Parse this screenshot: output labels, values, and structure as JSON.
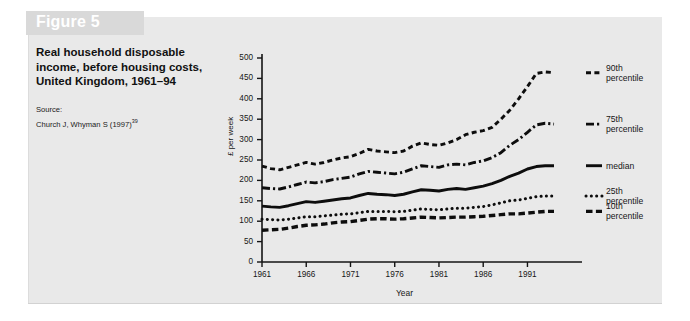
{
  "figure": {
    "banner_label": "Figure 5",
    "title_lines": [
      "Real household disposable",
      "income, before housing costs,",
      "United Kingdom, 1961–94"
    ],
    "source_heading": "Source:",
    "source_citation": "Church J, Whyman S (1997)",
    "source_ref": "39"
  },
  "colors": {
    "panel_background": "#e9e9e9",
    "page_background": "#ffffff",
    "banner": "#d9d9d9",
    "banner_text": "#ffffff",
    "ink": "#111111",
    "axis": "#1a1a1a"
  },
  "chart_data": {
    "type": "line",
    "title": "Real household disposable income, before housing costs, United Kingdom, 1961–94",
    "xlabel": "Year",
    "ylabel": "£ per week",
    "xlim": [
      1961,
      1994
    ],
    "ylim": [
      0,
      500
    ],
    "ytick_labels": [
      "0",
      "50",
      "100",
      "150",
      "200",
      "250",
      "300",
      "350",
      "400",
      "450",
      "500"
    ],
    "yticks": [
      0,
      50,
      100,
      150,
      200,
      250,
      300,
      350,
      400,
      450,
      500
    ],
    "xtick_labels": [
      "1961",
      "1966",
      "1971",
      "1976",
      "1981",
      "1986",
      "1991"
    ],
    "xticks": [
      1961,
      1966,
      1971,
      1976,
      1981,
      1986,
      1991
    ],
    "grid": false,
    "legend_position": "right",
    "x": [
      1961,
      1962,
      1963,
      1964,
      1965,
      1966,
      1967,
      1968,
      1969,
      1970,
      1971,
      1972,
      1973,
      1974,
      1975,
      1976,
      1977,
      1978,
      1979,
      1980,
      1981,
      1982,
      1983,
      1984,
      1985,
      1986,
      1987,
      1988,
      1989,
      1990,
      1991,
      1992,
      1993,
      1994
    ],
    "series": [
      {
        "name": "90th percentile",
        "legend_label_lines": [
          "90th",
          "percentile"
        ],
        "style": "dashed",
        "values": [
          235,
          229,
          226,
          232,
          238,
          244,
          240,
          244,
          250,
          255,
          258,
          266,
          276,
          272,
          270,
          268,
          272,
          284,
          292,
          288,
          286,
          292,
          300,
          312,
          318,
          322,
          330,
          350,
          372,
          400,
          430,
          462,
          466,
          464
        ]
      },
      {
        "name": "75th percentile",
        "legend_label_lines": [
          "75th",
          "percentile"
        ],
        "style": "dash-dot",
        "values": [
          182,
          180,
          179,
          184,
          190,
          196,
          194,
          197,
          202,
          205,
          208,
          216,
          222,
          220,
          218,
          216,
          220,
          228,
          236,
          234,
          232,
          238,
          240,
          238,
          244,
          248,
          256,
          268,
          286,
          300,
          318,
          336,
          340,
          338
        ]
      },
      {
        "name": "median",
        "legend_label_lines": [
          "median"
        ],
        "style": "solid",
        "values": [
          137,
          135,
          134,
          138,
          143,
          148,
          146,
          149,
          152,
          155,
          157,
          163,
          168,
          166,
          165,
          163,
          166,
          172,
          177,
          176,
          174,
          178,
          180,
          178,
          182,
          186,
          192,
          200,
          210,
          218,
          228,
          234,
          236,
          236
        ]
      },
      {
        "name": "25th percentile",
        "legend_label_lines": [
          "25th",
          "percentile"
        ],
        "style": "dotted",
        "values": [
          105,
          104,
          103,
          105,
          108,
          111,
          111,
          113,
          115,
          117,
          118,
          121,
          124,
          124,
          124,
          123,
          124,
          127,
          130,
          129,
          128,
          130,
          132,
          132,
          134,
          136,
          140,
          145,
          150,
          152,
          156,
          160,
          162,
          162
        ]
      },
      {
        "name": "10th percentile",
        "legend_label_lines": [
          "10th",
          "percentile"
        ],
        "style": "dashed-thick",
        "values": [
          78,
          79,
          80,
          83,
          87,
          90,
          91,
          93,
          96,
          98,
          99,
          102,
          105,
          106,
          106,
          105,
          106,
          108,
          110,
          109,
          108,
          109,
          110,
          110,
          111,
          112,
          114,
          116,
          118,
          118,
          120,
          122,
          124,
          124
        ]
      }
    ]
  }
}
